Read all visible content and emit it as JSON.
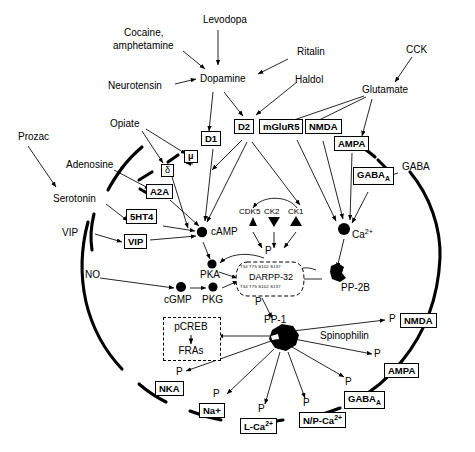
{
  "diagram": {
    "type": "signaling-pathway"
  },
  "extracellular_ligands": [
    {
      "id": "cocaine",
      "label": "Cocaine,"
    },
    {
      "id": "amphetamine",
      "label": "amphetamine"
    },
    {
      "id": "levodopa",
      "label": "Levodopa"
    },
    {
      "id": "ritalin",
      "label": "Ritalin"
    },
    {
      "id": "cck",
      "label": "CCK"
    },
    {
      "id": "neurotensin",
      "label": "Neurotensin"
    },
    {
      "id": "dopamine",
      "label": "Dopamine"
    },
    {
      "id": "haldol",
      "label": "Haldol"
    },
    {
      "id": "glutamate",
      "label": "Glutamate"
    },
    {
      "id": "prozac",
      "label": "Prozac"
    },
    {
      "id": "opiate",
      "label": "Opiate"
    },
    {
      "id": "adenosine",
      "label": "Adenosine"
    },
    {
      "id": "serotonin",
      "label": "Serotonin"
    },
    {
      "id": "vip",
      "label": "VIP"
    },
    {
      "id": "no",
      "label": "NO"
    },
    {
      "id": "gaba",
      "label": "GABA"
    }
  ],
  "membrane_receptors": [
    {
      "id": "d1",
      "label": "D1"
    },
    {
      "id": "d2",
      "label": "D2"
    },
    {
      "id": "mglur5",
      "label": "mGluR5"
    },
    {
      "id": "nmda",
      "label": "NMDA"
    },
    {
      "id": "ampa",
      "label": "AMPA"
    },
    {
      "id": "gabaa",
      "label": "GABA",
      "sub": "A"
    },
    {
      "id": "mu",
      "label": "μ"
    },
    {
      "id": "delta",
      "label": "δ"
    },
    {
      "id": "a2a",
      "label": "A2A"
    },
    {
      "id": "5ht4",
      "label": "5HT4"
    },
    {
      "id": "vipr",
      "label": "VIP"
    }
  ],
  "intracellular_nodes": [
    {
      "id": "camp",
      "label": "cAMP"
    },
    {
      "id": "pka",
      "label": "PKA"
    },
    {
      "id": "cgmp",
      "label": "cGMP"
    },
    {
      "id": "pkg",
      "label": "PKG"
    },
    {
      "id": "ca",
      "label": "Ca",
      "sup": "2+"
    },
    {
      "id": "pp2b",
      "label": "PP-2B"
    },
    {
      "id": "pp1",
      "label": "PP-1"
    },
    {
      "id": "spinophilin",
      "label": "Spinophilin"
    }
  ],
  "kinases": [
    {
      "id": "cdk5",
      "label": "CDK5"
    },
    {
      "id": "ck2",
      "label": "CK2"
    },
    {
      "id": "ck1",
      "label": "CK1"
    }
  ],
  "darpp32": {
    "name": "DARPP-32",
    "residues_top": "T34  T75  S102  S137",
    "residues_bottom": "T34  T75  S102  S137",
    "p_above": "P",
    "p_below": "P"
  },
  "nucleus_box": {
    "pcreb": "pCREB",
    "fras": "FRAs"
  },
  "effector_targets": [
    {
      "id": "nka",
      "label": "NKA",
      "p": "P"
    },
    {
      "id": "na",
      "label": "Na+",
      "p": "P"
    },
    {
      "id": "lca",
      "label": "L-Ca",
      "sup": "2+",
      "p": "P"
    },
    {
      "id": "npca",
      "label": "N/P-Ca",
      "sup": "2+",
      "p": "P"
    },
    {
      "id": "gabaa2",
      "label": "GABA",
      "sub": "A",
      "p": "P"
    },
    {
      "id": "ampa2",
      "label": "AMPA",
      "p": "P"
    },
    {
      "id": "nmda2",
      "label": "NMDA",
      "p": "P"
    }
  ],
  "colors": {
    "ink": "#000000",
    "background": "#ffffff",
    "membrane": "#000000"
  }
}
